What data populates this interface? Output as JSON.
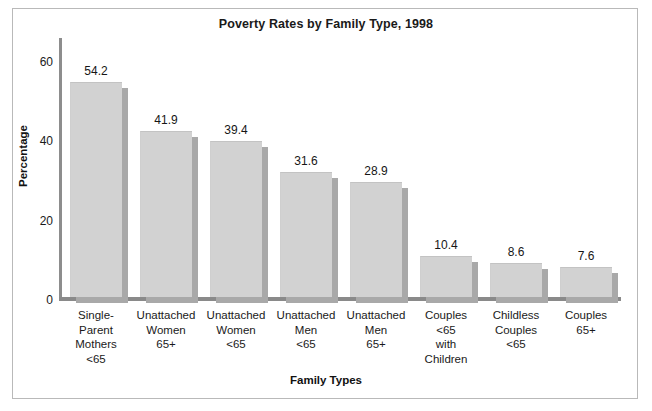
{
  "chart_data": {
    "type": "bar",
    "title": "Poverty Rates by Family Type, 1998",
    "xlabel": "Family Types",
    "ylabel": "Percentage",
    "categories": [
      "Single-\nParent\nMothers\n<65",
      "Unattached\nWomen\n65+",
      "Unattached\nWomen\n<65",
      "Unattached\nMen\n<65",
      "Unattached\nMen\n65+",
      "Couples\n<65\nwith\nChildren",
      "Childless\nCouples\n<65",
      "Couples\n65+"
    ],
    "values": [
      54.2,
      41.9,
      39.4,
      31.6,
      28.9,
      10.4,
      8.6,
      7.6
    ],
    "value_labels": [
      "54.2",
      "41.9",
      "39.4",
      "31.6",
      "28.9",
      "10.4",
      "8.6",
      "7.6"
    ],
    "ylim": [
      0,
      66
    ],
    "yticks": [
      0,
      20,
      40,
      60
    ],
    "ytick_labels": [
      "0",
      "20",
      "40",
      "60"
    ],
    "grid": false,
    "legend": "none",
    "bar_color": "#d2d2d2",
    "bar_shadow_color": "#a9a9a9",
    "axis_color": "#8a8a8a",
    "text_color": "#1a1a1a"
  },
  "axis": {
    "y_title": "Percentage",
    "x_title": "Family Types"
  },
  "title": "Poverty Rates by Family Type, 1998"
}
